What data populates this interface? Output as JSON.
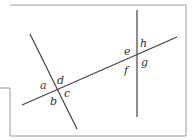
{
  "diagram": {
    "labels": {
      "a": "a",
      "b": "b",
      "c": "c",
      "d": "d",
      "e": "e",
      "f": "f",
      "g": "g",
      "h": "h"
    },
    "colors": {
      "line": "#444444",
      "border": "#999999"
    }
  }
}
